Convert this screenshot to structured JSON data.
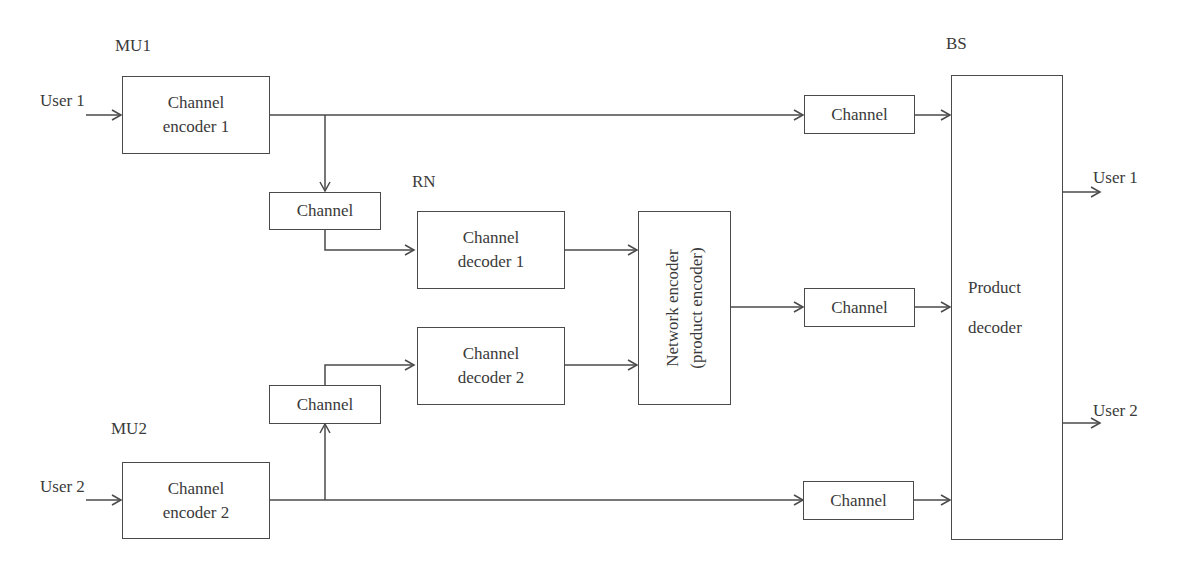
{
  "labels": {
    "mu1": "MU1",
    "mu2": "MU2",
    "rn": "RN",
    "bs": "BS",
    "user1_in": "User 1",
    "user2_in": "User 2",
    "user1_out": "User 1",
    "user2_out": "User 2"
  },
  "blocks": {
    "enc1": {
      "line1": "Channel",
      "line2": "encoder 1"
    },
    "enc2": {
      "line1": "Channel",
      "line2": "encoder 2"
    },
    "ch_relay1": "Channel",
    "ch_relay2": "Channel",
    "dec1": {
      "line1": "Channel",
      "line2": "decoder 1"
    },
    "dec2": {
      "line1": "Channel",
      "line2": "decoder 2"
    },
    "netenc": {
      "line1": "Network encoder",
      "line2": "(product encoder)"
    },
    "ch_top": "Channel",
    "ch_mid": "Channel",
    "ch_bot": "Channel",
    "proddec": {
      "line1": "Product",
      "line2": "decoder"
    }
  },
  "colors": {
    "line": "#4a4a4a",
    "text": "#3a3a3a",
    "background": "#ffffff"
  }
}
